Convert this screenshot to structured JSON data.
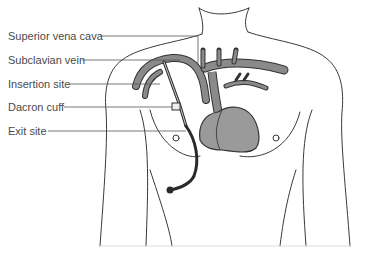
{
  "diagram": {
    "labels": [
      {
        "id": "superior-vena-cava",
        "text": "Superior vena cava",
        "y": 36
      },
      {
        "id": "subclavian-vein",
        "text": "Subclavian vein",
        "y": 60
      },
      {
        "id": "insertion-site",
        "text": "Insertion site",
        "y": 84
      },
      {
        "id": "dacron-cuff",
        "text": "Dacron cuff",
        "y": 107
      },
      {
        "id": "exit-site",
        "text": "Exit site",
        "y": 131
      }
    ],
    "colors": {
      "outline": "#3a3a3a",
      "vessel_fill": "#8a8a8a",
      "heart_fill": "#9a9a9a",
      "catheter": "#2a2a2a",
      "label_text": "#4a4a4a",
      "leader_line": "#555555"
    }
  }
}
